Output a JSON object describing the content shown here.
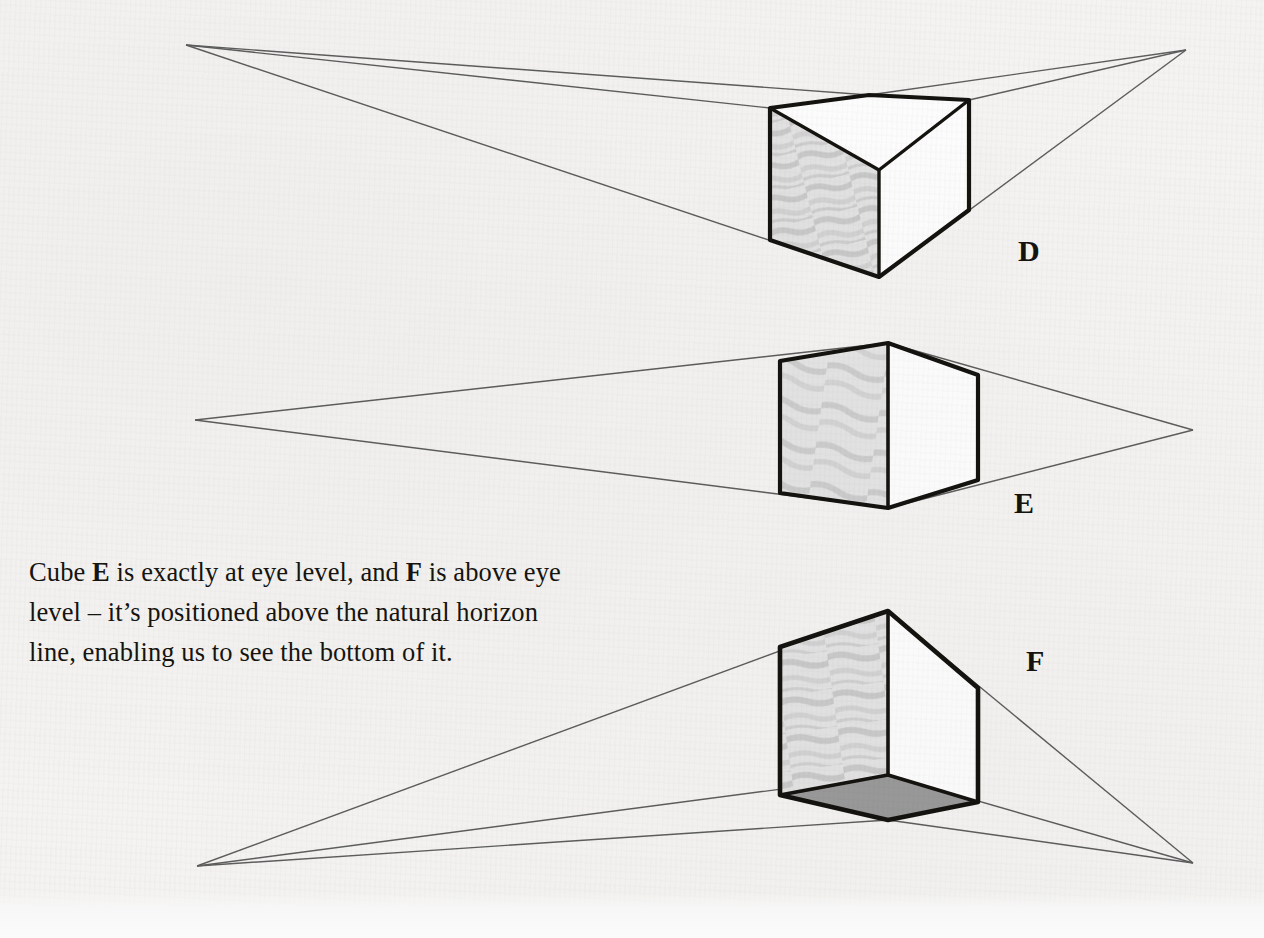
{
  "page": {
    "background_color": "#f4f3f1",
    "ink_color": "#15130f",
    "guide_line_color": "#5d5d5d",
    "shaded_face_color": "#dcdcdc",
    "bottom_face_color": "#9a9a9a",
    "lit_face_color": "#fdfdfd"
  },
  "caption": {
    "line1_part1": "Cube ",
    "line1_bold1": "E",
    "line1_part2": " is exactly at eye level, and ",
    "line1_bold2": "F",
    "line1_part3": " is above eye",
    "line2": "level – it’s positioned above the natural horizon",
    "line3": "line, enabling us to see the bottom of it.",
    "full_text": "Cube E is exactly at eye level, and F is above eye level – it’s positioned above the natural horizon line, enabling us to see the bottom of it."
  },
  "figures": [
    {
      "id": "cube-d",
      "label": "D",
      "label_x": 1018,
      "label_y": 236,
      "eye_level_relation": "below eye level",
      "visible_faces": [
        "top",
        "left-shaded",
        "right-lit"
      ],
      "vanishing_point_left": {
        "x": 186,
        "y": 45
      },
      "vanishing_point_right": {
        "x": 1186,
        "y": 50
      },
      "vertices": {
        "front_bottom": {
          "x": 879,
          "y": 277
        },
        "left_bottom": {
          "x": 770,
          "y": 240
        },
        "right_bottom": {
          "x": 969,
          "y": 210
        },
        "front_top": {
          "x": 879,
          "y": 170
        },
        "left_top": {
          "x": 770,
          "y": 108
        },
        "right_top": {
          "x": 969,
          "y": 100
        },
        "back_top": {
          "x": 869,
          "y": 95
        }
      }
    },
    {
      "id": "cube-e",
      "label": "E",
      "label_x": 1014,
      "label_y": 488,
      "eye_level_relation": "exactly at eye level",
      "visible_faces": [
        "left-shaded",
        "right-lit"
      ],
      "vanishing_point_left": {
        "x": 195,
        "y": 420
      },
      "vanishing_point_right": {
        "x": 1193,
        "y": 430
      },
      "vertices": {
        "front_bottom": {
          "x": 888,
          "y": 508
        },
        "left_bottom": {
          "x": 780,
          "y": 493
        },
        "right_bottom": {
          "x": 978,
          "y": 480
        },
        "front_top": {
          "x": 888,
          "y": 343
        },
        "left_top": {
          "x": 780,
          "y": 361
        },
        "right_top": {
          "x": 978,
          "y": 375
        }
      }
    },
    {
      "id": "cube-f",
      "label": "F",
      "label_x": 1026,
      "label_y": 646,
      "eye_level_relation": "above eye level",
      "visible_faces": [
        "bottom",
        "left-shaded",
        "right-lit"
      ],
      "vanishing_point_left": {
        "x": 197,
        "y": 866
      },
      "vanishing_point_right": {
        "x": 1193,
        "y": 863
      },
      "vertices": {
        "front_top": {
          "x": 888,
          "y": 611
        },
        "left_top": {
          "x": 780,
          "y": 647
        },
        "right_top": {
          "x": 978,
          "y": 688
        },
        "front_bottom": {
          "x": 888,
          "y": 775
        },
        "left_bottom": {
          "x": 780,
          "y": 795
        },
        "right_bottom": {
          "x": 978,
          "y": 802
        },
        "back_bottom": {
          "x": 888,
          "y": 820
        }
      }
    }
  ]
}
